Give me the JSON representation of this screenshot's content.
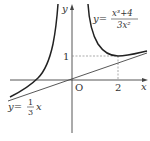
{
  "figure": {
    "axes": {
      "x_label": "x",
      "y_label": "y",
      "origin_label": "O",
      "x_tick": "2",
      "y_tick": "1"
    },
    "curve": {
      "lhs": "y=",
      "numerator": "x³+4",
      "denominator": "3x²"
    },
    "asymptote": {
      "lhs": "y=",
      "frac_num": "1",
      "frac_den": "3",
      "rhs": "x"
    },
    "colors": {
      "curve": "#222222",
      "line": "#444444",
      "axis": "#444444",
      "dashed": "#888888"
    }
  }
}
